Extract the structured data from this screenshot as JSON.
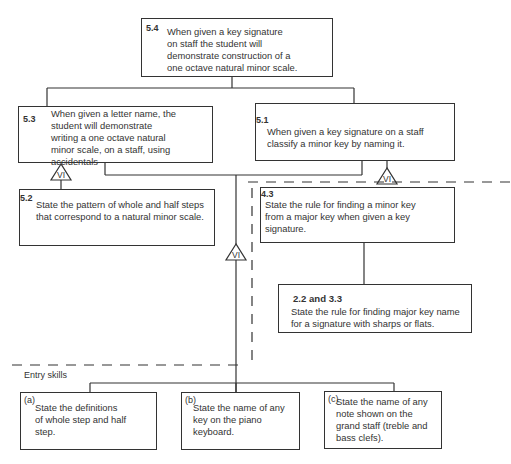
{
  "diagram": {
    "nodes": [
      {
        "id": "5.4",
        "number": "5.4",
        "text_lines": [
          "When given a key signature",
          "on staff the student will",
          "demonstrate construction of a",
          "one octave natural minor scale."
        ]
      },
      {
        "id": "5.3",
        "number": "5.3",
        "text_lines": [
          "When given a letter name, the",
          "student will demonstrate",
          "writing a one octave natural",
          "minor scale, on a staff, using",
          "accidentals"
        ]
      },
      {
        "id": "5.1",
        "number": "5.1",
        "text_lines": [
          "When given a key signature on a staff",
          "classify a minor key by naming it."
        ]
      },
      {
        "id": "5.2",
        "number": "5.2",
        "text_lines": [
          "State the pattern of whole and half steps",
          "that correspond to a natural minor scale."
        ]
      },
      {
        "id": "4.3",
        "number": "4.3",
        "text_lines": [
          "State the rule for finding a minor key",
          "from a major key when given a key",
          "signature."
        ]
      },
      {
        "id": "2.2-3.3",
        "number": "2.2 and 3.3",
        "text_lines": [
          "State the rule for finding major key name",
          "for a signature with sharps or flats."
        ]
      },
      {
        "id": "a",
        "number": "(a)",
        "text_lines": [
          "State the definitions",
          "of whole step and half",
          "step."
        ]
      },
      {
        "id": "b",
        "number": "(b)",
        "text_lines": [
          "State the name of any",
          "key on the piano",
          "keyboard."
        ]
      },
      {
        "id": "c",
        "number": "(c)",
        "text_lines": [
          "State the name of any",
          "note shown on the",
          "grand staff (treble and",
          "bass clefs)."
        ]
      }
    ],
    "verbal_info_marker": "VI",
    "entry_skills_label": "Entry skills"
  }
}
